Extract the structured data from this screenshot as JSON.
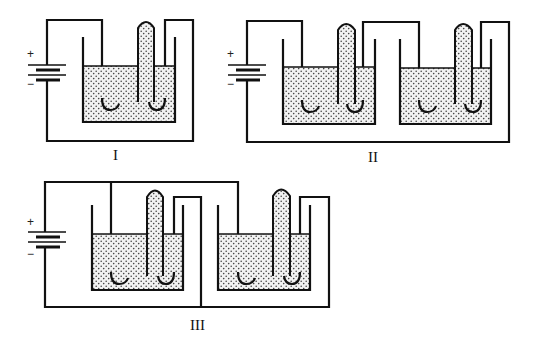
{
  "diagram": {
    "type": "electrolysis-circuits",
    "circuits": [
      {
        "id": "I",
        "label": "I",
        "cells": 1,
        "arrangement": "single cell",
        "battery": {
          "positive": "+",
          "negative": "−"
        }
      },
      {
        "id": "II",
        "label": "II",
        "cells": 2,
        "arrangement": "series",
        "battery": {
          "positive": "+",
          "negative": "−"
        }
      },
      {
        "id": "III",
        "label": "III",
        "cells": 2,
        "arrangement": "parallel",
        "battery": {
          "positive": "+",
          "negative": "−"
        }
      }
    ],
    "components": {
      "cell": "beaker with stippled electrolyte, J-shaped electrode and inverted gas collection tube",
      "battery_symbol": "battery-icon"
    },
    "colors": {
      "line": "#111111",
      "background": "#ffffff",
      "stipple": "#444444"
    }
  }
}
